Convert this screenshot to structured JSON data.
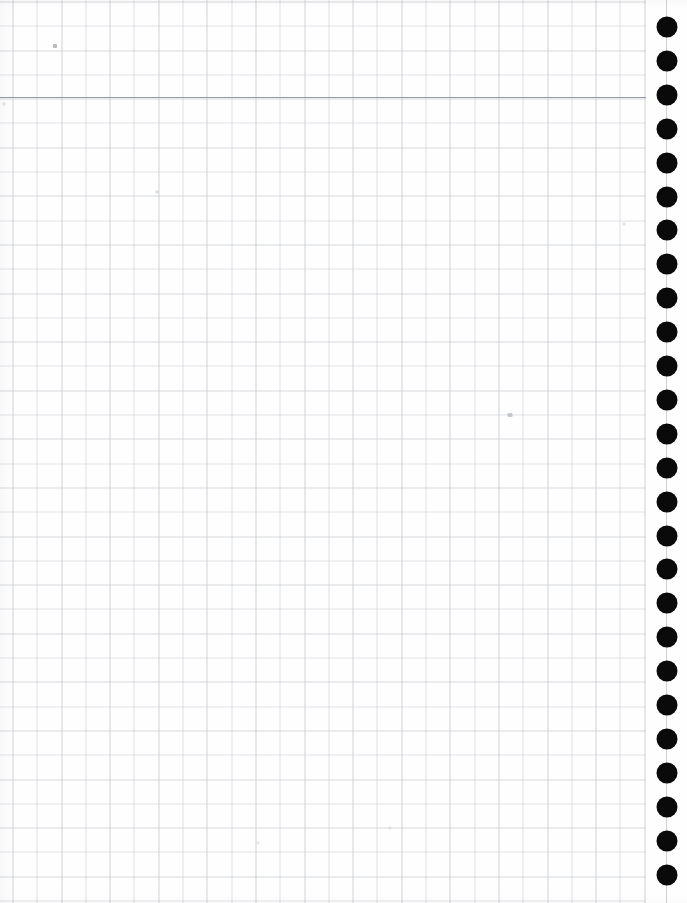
{
  "page": {
    "kind": "scanned-graph-paper",
    "width": 687,
    "height": 903,
    "paper_color": "#fefefe",
    "visible_text": ""
  },
  "grid": {
    "minor_spacing_px": 24.3,
    "major_spacing_px": 48.6,
    "line_color": "#c4c8ce",
    "accent_line_color": "#bcc0c8",
    "grid_right_edge_px": 646,
    "grid_origin_x_px": 12.5,
    "grid_origin_y_px": 1.5
  },
  "header_rule": {
    "y_px": 97,
    "color": "#969baa"
  },
  "binding": {
    "hole_color": "#0a0a0a",
    "hole_diameter_px": 21,
    "center_x_px": 667,
    "first_center_y_px": 27,
    "spacing_px": 33.9,
    "count": 26,
    "guide_line_color": "#cdd0d6"
  },
  "specks": [
    {
      "x": 55,
      "y": 46,
      "w": 4,
      "h": 4,
      "color": "rgba(168,170,176,0.80)"
    },
    {
      "x": 157,
      "y": 192,
      "w": 3,
      "h": 3,
      "color": "rgba(205,207,212,0.75)"
    },
    {
      "x": 510,
      "y": 415,
      "w": 5,
      "h": 4,
      "color": "rgba(178,180,186,0.70)"
    },
    {
      "x": 4,
      "y": 104,
      "w": 3,
      "h": 3,
      "color": "rgba(210,212,216,0.70)"
    },
    {
      "x": 624,
      "y": 224,
      "w": 3,
      "h": 3,
      "color": "rgba(212,214,218,0.65)"
    },
    {
      "x": 258,
      "y": 843,
      "w": 3,
      "h": 3,
      "color": "rgba(214,216,220,0.60)"
    },
    {
      "x": 390,
      "y": 828,
      "w": 3,
      "h": 3,
      "color": "rgba(214,216,220,0.60)"
    }
  ]
}
